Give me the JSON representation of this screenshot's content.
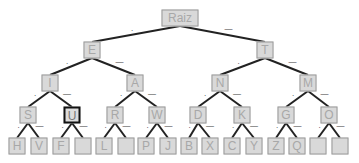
{
  "tree": {
    "title": "Morse code tree",
    "root_label": "Raiz",
    "selected_node": "U",
    "edge_labels": {
      "left": ".",
      "right": "—"
    },
    "colors": {
      "node_fill": "#d9d9d9",
      "node_border": "#9a9a9a",
      "node_text": "#a8a8a8",
      "edge": "#222222",
      "selected_border": "#111111"
    },
    "levels": [
      [
        "Raiz"
      ],
      [
        "E",
        "T"
      ],
      [
        "I",
        "A",
        "N",
        "M"
      ],
      [
        "S",
        "U",
        "R",
        "W",
        "D",
        "K",
        "G",
        "O"
      ],
      [
        "H",
        "V",
        "F",
        "",
        "L",
        "",
        "P",
        "J",
        "B",
        "X",
        "C",
        "Y",
        "Z",
        "Q",
        "",
        ""
      ]
    ]
  }
}
